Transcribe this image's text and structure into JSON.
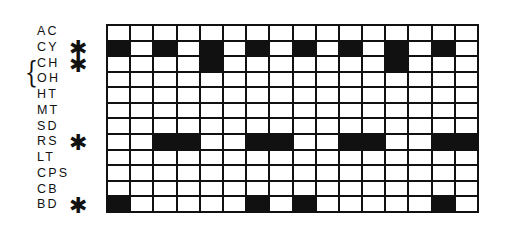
{
  "diagram": {
    "type": "timing-grid",
    "columns": 16,
    "rows": [
      {
        "label": "AC",
        "marked": false,
        "filled": []
      },
      {
        "label": "CY",
        "marked": true,
        "filled": [
          1,
          3,
          5,
          7,
          9,
          11,
          13,
          15
        ]
      },
      {
        "label": "CH",
        "marked": true,
        "filled": [
          5,
          13
        ]
      },
      {
        "label": "OH",
        "marked": false,
        "filled": []
      },
      {
        "label": "HT",
        "marked": false,
        "filled": []
      },
      {
        "label": "MT",
        "marked": false,
        "filled": []
      },
      {
        "label": "SD",
        "marked": false,
        "filled": []
      },
      {
        "label": "RS",
        "marked": true,
        "filled": [
          3,
          4,
          7,
          8,
          11,
          12,
          15,
          16
        ]
      },
      {
        "label": "LT",
        "marked": false,
        "filled": []
      },
      {
        "label": "CPS",
        "marked": false,
        "filled": []
      },
      {
        "label": "CB",
        "marked": false,
        "filled": []
      },
      {
        "label": "BD",
        "marked": true,
        "filled": [
          1,
          7,
          9,
          15
        ]
      }
    ],
    "marker_glyph": "✱",
    "brace": {
      "glyph": "{",
      "spans_rows": [
        3,
        4
      ]
    },
    "colors": {
      "fill": "#111111",
      "empty": "#ffffff",
      "line": "#111111"
    }
  }
}
